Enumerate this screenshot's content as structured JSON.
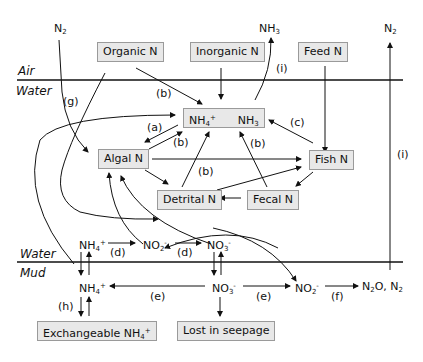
{
  "zones": {
    "air": "Air",
    "water_top": "Water",
    "water_bottom": "Water",
    "mud": "Mud"
  },
  "boxes": {
    "organic_n": "Organic  N",
    "inorganic_n": "Inorganic N",
    "feed_n": "Feed N",
    "ammonium_ammonia_nh4": "NH",
    "ammonium_ammonia_nh3": "NH",
    "algal_n": "Algal N",
    "fish_n": "Fish N",
    "detrital_n": "Detrital N",
    "fecal_n": "Fecal N",
    "exchangeable_nh4": "Exchangeable NH",
    "lost_in_seepage": "Lost in seepage"
  },
  "species": {
    "n2_left": "N",
    "nh3_top": "NH",
    "n2_right": "N",
    "water_nh4": "NH",
    "water_no2": "NO",
    "water_no3": "NO",
    "mud_nh4": "NH",
    "mud_no3": "NO",
    "mud_no2": "NO",
    "n2o_n2_a": "N",
    "n2o_n2_b": "O, N"
  },
  "subscripts": {
    "two": "2",
    "three": "3",
    "four": "4"
  },
  "superscripts": {
    "plus": "+",
    "minus": "-"
  },
  "process_labels": {
    "a": "(a)",
    "b": "(b)",
    "c": "(c)",
    "d": "(d)",
    "e": "(e)",
    "f": "(f)",
    "g": "(g)",
    "h": "(h)",
    "i": "(i)"
  }
}
